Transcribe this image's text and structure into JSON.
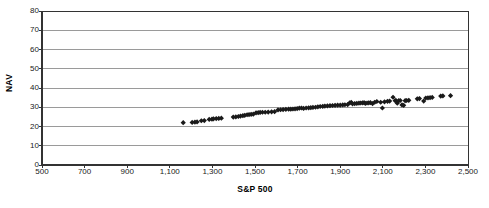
{
  "chart_data": {
    "type": "scatter",
    "title": "",
    "xlabel": "S&P  500",
    "ylabel": "NAV",
    "xlim": [
      500,
      2500
    ],
    "ylim": [
      0,
      80
    ],
    "xticks": [
      "500",
      "700",
      "900",
      "1,100",
      "1,300",
      "1,500",
      "1,700",
      "1,900",
      "2,100",
      "2,300",
      "2,500"
    ],
    "xtick_values": [
      500,
      700,
      900,
      1100,
      1300,
      1500,
      1700,
      1900,
      2100,
      2300,
      2500
    ],
    "yticks": [
      "0",
      "10",
      "20",
      "30",
      "40",
      "50",
      "60",
      "70",
      "80"
    ],
    "ytick_values": [
      0,
      10,
      20,
      30,
      40,
      50,
      60,
      70,
      80
    ],
    "grid": "horizontal",
    "legend": "none",
    "marker": "diamond",
    "marker_color": "#1a1a1a",
    "marker_size": 2.6,
    "series": [
      {
        "name": "NAV vs S&P 500",
        "points": [
          [
            1163,
            22.0
          ],
          [
            1205,
            22.1
          ],
          [
            1218,
            22.3
          ],
          [
            1228,
            22.4
          ],
          [
            1248,
            23.0
          ],
          [
            1262,
            23.1
          ],
          [
            1285,
            23.7
          ],
          [
            1298,
            23.8
          ],
          [
            1305,
            24.0
          ],
          [
            1318,
            24.1
          ],
          [
            1330,
            24.2
          ],
          [
            1342,
            24.3
          ],
          [
            1398,
            24.9
          ],
          [
            1410,
            25.0
          ],
          [
            1422,
            25.2
          ],
          [
            1432,
            25.4
          ],
          [
            1443,
            25.6
          ],
          [
            1452,
            25.8
          ],
          [
            1463,
            26.1
          ],
          [
            1472,
            26.2
          ],
          [
            1482,
            26.3
          ],
          [
            1492,
            26.4
          ],
          [
            1505,
            27.1
          ],
          [
            1515,
            27.2
          ],
          [
            1524,
            27.3
          ],
          [
            1535,
            27.4
          ],
          [
            1548,
            27.4
          ],
          [
            1562,
            27.5
          ],
          [
            1578,
            27.6
          ],
          [
            1592,
            27.7
          ],
          [
            1608,
            28.6
          ],
          [
            1620,
            28.7
          ],
          [
            1632,
            28.8
          ],
          [
            1645,
            28.9
          ],
          [
            1658,
            29.0
          ],
          [
            1668,
            29.0
          ],
          [
            1678,
            29.1
          ],
          [
            1688,
            29.2
          ],
          [
            1698,
            29.3
          ],
          [
            1708,
            29.5
          ],
          [
            1718,
            29.6
          ],
          [
            1728,
            29.4
          ],
          [
            1740,
            29.6
          ],
          [
            1752,
            29.7
          ],
          [
            1762,
            29.8
          ],
          [
            1772,
            29.9
          ],
          [
            1784,
            30.0
          ],
          [
            1795,
            30.2
          ],
          [
            1806,
            30.4
          ],
          [
            1818,
            30.5
          ],
          [
            1828,
            30.6
          ],
          [
            1840,
            30.7
          ],
          [
            1852,
            30.8
          ],
          [
            1864,
            30.9
          ],
          [
            1876,
            31.0
          ],
          [
            1888,
            31.1
          ],
          [
            1900,
            31.1
          ],
          [
            1912,
            31.2
          ],
          [
            1922,
            31.3
          ],
          [
            1935,
            31.4
          ],
          [
            1945,
            32.3
          ],
          [
            1952,
            32.5
          ],
          [
            1958,
            31.8
          ],
          [
            1968,
            31.9
          ],
          [
            1978,
            32.0
          ],
          [
            1988,
            32.1
          ],
          [
            1996,
            32.2
          ],
          [
            2005,
            32.3
          ],
          [
            2012,
            32.4
          ],
          [
            2018,
            32.0
          ],
          [
            2026,
            32.2
          ],
          [
            2034,
            32.3
          ],
          [
            2042,
            32.4
          ],
          [
            2052,
            31.9
          ],
          [
            2062,
            32.6
          ],
          [
            2072,
            33.0
          ],
          [
            2090,
            32.6
          ],
          [
            2098,
            29.6
          ],
          [
            2108,
            32.8
          ],
          [
            2122,
            33.1
          ],
          [
            2132,
            33.2
          ],
          [
            2148,
            35.2
          ],
          [
            2158,
            33.4
          ],
          [
            2162,
            33.5
          ],
          [
            2168,
            32.1
          ],
          [
            2175,
            33.4
          ],
          [
            2182,
            33.5
          ],
          [
            2190,
            31.2
          ],
          [
            2198,
            31.0
          ],
          [
            2205,
            33.4
          ],
          [
            2212,
            33.5
          ],
          [
            2222,
            33.6
          ],
          [
            2262,
            34.4
          ],
          [
            2272,
            34.5
          ],
          [
            2292,
            33.2
          ],
          [
            2302,
            34.8
          ],
          [
            2312,
            34.9
          ],
          [
            2322,
            35.0
          ],
          [
            2332,
            35.1
          ],
          [
            2372,
            35.8
          ],
          [
            2382,
            35.9
          ],
          [
            2418,
            36.0
          ]
        ]
      }
    ]
  }
}
